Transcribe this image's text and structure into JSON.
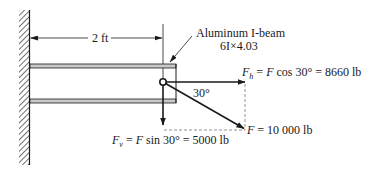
{
  "diagram": {
    "dimension": {
      "label": "2 ft"
    },
    "beam": {
      "name": "Aluminum I-beam",
      "designation": "6I×4.03"
    },
    "angle": {
      "label": "30°"
    },
    "forces": {
      "horizontal": {
        "symbol": "F",
        "subscript": "h",
        "expression": " = ",
        "expr_var": "F",
        "expr_rest": " cos 30° = 8660 lb"
      },
      "vertical": {
        "symbol": "F",
        "subscript": "v",
        "expression": " = ",
        "expr_var": "F",
        "expr_rest": " sin 30° = 5000 lb"
      },
      "resultant": {
        "symbol": "F",
        "value_text": " = 10 000 lb"
      }
    },
    "colors": {
      "ink": "#1a1a1a",
      "beam_fill": "#c8c8c8",
      "dashed": "#777777"
    }
  }
}
